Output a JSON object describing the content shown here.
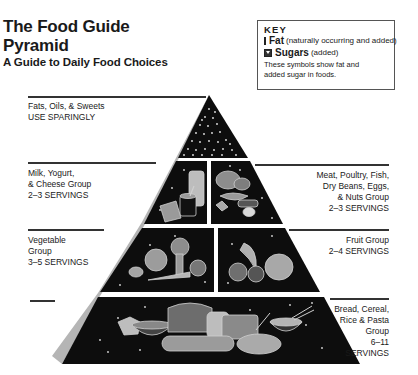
{
  "header": {
    "title_line1": "The Food Guide",
    "title_line2": "Pyramid",
    "subtitle": "A Guide to Daily Food Choices"
  },
  "key": {
    "title": "KEY",
    "items": [
      {
        "symbol": "fat-circle-icon",
        "name": "Fat",
        "note": "(naturally occurring and added)"
      },
      {
        "symbol": "sugar-triangle-icon",
        "name": "Sugars",
        "note": "(added)"
      }
    ],
    "footnote_line1": "These symbols show fat and",
    "footnote_line2": "added sugar in foods."
  },
  "groups": [
    {
      "id": "fats",
      "line1": "Fats, Oils, & Sweets",
      "servings": "USE SPARINGLY",
      "side": "left"
    },
    {
      "id": "milk",
      "line1": "Milk, Yogurt,",
      "line2": "& Cheese Group",
      "servings": "2–3 SERVINGS",
      "side": "left"
    },
    {
      "id": "meat",
      "line1": "Meat, Poultry, Fish,",
      "line2": "Dry Beans, Eggs,",
      "line3": "& Nuts Group",
      "servings": "2–3 SERVINGS",
      "side": "right"
    },
    {
      "id": "vegetable",
      "line1": "Vegetable",
      "line2": "Group",
      "servings": "3–5 SERVINGS",
      "side": "left"
    },
    {
      "id": "fruit",
      "line1": "Fruit Group",
      "servings": "2–4 SERVINGS",
      "side": "right"
    },
    {
      "id": "bread",
      "line1": "Bread, Cereal,",
      "line2": "Rice & Pasta",
      "line3": "Group",
      "line4": "6–11",
      "servings": "SERVINGS",
      "side": "right"
    }
  ],
  "colors": {
    "tier_fill": "#0d0d0d",
    "side_face": "#b5b5b5",
    "food_outline": "#cfcfcf",
    "food_fill": "#8a8a8a"
  }
}
